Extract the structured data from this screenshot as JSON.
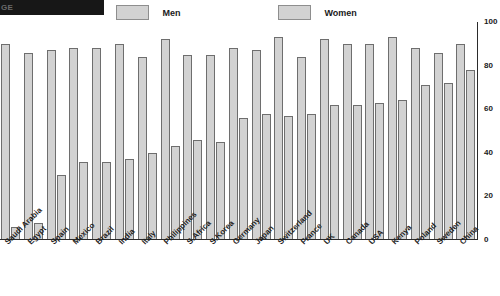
{
  "header": {
    "title_banner": "GE",
    "legend": {
      "men_label": "Men",
      "women_label": "Women",
      "swatch_color": "#d2d2d2",
      "swatch_border": "#8e8e8e"
    }
  },
  "axis": {
    "yticks": [
      "0",
      "20",
      "40",
      "60",
      "80",
      "100"
    ]
  },
  "chart_data": {
    "type": "bar",
    "title": "",
    "subtitle": "",
    "xlabel": "",
    "ylabel": "",
    "ylim": [
      0,
      100
    ],
    "yticks": [
      0,
      20,
      40,
      60,
      80,
      100
    ],
    "grid": false,
    "legend_position": "top",
    "bar_color": "#d2d2d2",
    "bar_border_color": "#6e6e6e",
    "categories": [
      "Saudi Arabia",
      "Egypt",
      "Spain",
      "Mexico",
      "Brazil",
      "India",
      "Italy",
      "Philippines",
      "S.Africa",
      "S.Korea",
      "Germany",
      "Japan",
      "Switzerland",
      "France",
      "UK",
      "Canada",
      "USA",
      "Kenya",
      "Poland",
      "Sweden",
      "China"
    ],
    "series": [
      {
        "name": "Men",
        "values": [
          90,
          86,
          87,
          88,
          88,
          90,
          84,
          92,
          85,
          85,
          88,
          87,
          93,
          84,
          92,
          90,
          90,
          93,
          88,
          86,
          90
        ]
      },
      {
        "name": "Women",
        "values": [
          6,
          8,
          30,
          36,
          36,
          37,
          40,
          43,
          46,
          45,
          56,
          58,
          57,
          58,
          62,
          62,
          63,
          64,
          71,
          72,
          78
        ]
      }
    ]
  }
}
